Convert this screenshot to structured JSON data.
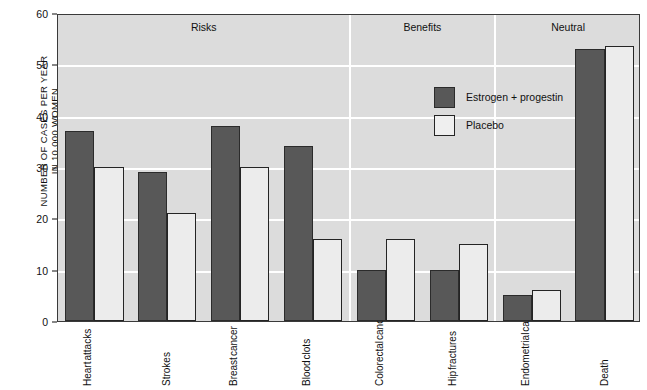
{
  "chart_data": {
    "type": "bar",
    "title": "",
    "xlabel": "",
    "ylabel": "NUMBER OF CASES PER YEAR IN 10,000 WOMEN",
    "ylabel_line1": "NUMBER OF CASES PER YEAR",
    "ylabel_line2": "IN 10,000 WOMEN",
    "ylim": [
      0,
      60
    ],
    "ytick_values": [
      0,
      10,
      20,
      30,
      40,
      50,
      60
    ],
    "ytick_labels": [
      "0",
      "10",
      "20",
      "30",
      "40",
      "50",
      "60"
    ],
    "grid": true,
    "legend_position": "upper-right-inside",
    "categories": [
      "Heart attacks",
      "Strokes",
      "Breast cancer",
      "Blood clots",
      "Colorectal cancer",
      "Hip fractures",
      "Endometrial cancer",
      "Death"
    ],
    "category_lines": [
      [
        "Heart",
        "attacks"
      ],
      [
        "Strokes",
        ""
      ],
      [
        "Breast",
        "cancer"
      ],
      [
        "Blood",
        "clots"
      ],
      [
        "Colorectal",
        "cancer"
      ],
      [
        "Hip",
        "fractures"
      ],
      [
        "Endometrial",
        "cancer"
      ],
      [
        "Death",
        ""
      ]
    ],
    "series": [
      {
        "name": "Estrogen + progestin",
        "color": "#585858",
        "values": [
          37,
          29,
          38,
          34,
          10,
          10,
          5,
          53
        ]
      },
      {
        "name": "Placebo",
        "color": "#ececec",
        "values": [
          30,
          21,
          30,
          16,
          16,
          15,
          6,
          53.5
        ]
      }
    ],
    "sections": [
      {
        "label": "Risks",
        "start_index": 0,
        "end_index": 3
      },
      {
        "label": "Benefits",
        "start_index": 4,
        "end_index": 5
      },
      {
        "label": "Neutral",
        "start_index": 6,
        "end_index": 7
      }
    ]
  },
  "colors": {
    "plot_background": "#dcdcdc",
    "gridline": "#ffffff",
    "axis": "#3a3a3a",
    "treatment_bar": "#585858",
    "placebo_bar": "#ececec",
    "bar_outline": "#242424",
    "text": "#111111"
  },
  "legend": {
    "items": [
      {
        "label": "Estrogen + progestin",
        "swatch": "treat"
      },
      {
        "label": "Placebo",
        "swatch": "ctrl"
      }
    ]
  },
  "caption": {
    "text": ""
  }
}
